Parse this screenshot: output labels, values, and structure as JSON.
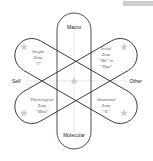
{
  "diagram": {
    "axes": {
      "top": "Macro",
      "bottom": "Molecular",
      "left": "Self",
      "right": "Other"
    },
    "zones": [
      {
        "id": "insight",
        "lines": [
          "Insight",
          "Zone",
          "“I”"
        ]
      },
      {
        "id": "social",
        "lines": [
          "Social",
          "Zone",
          "“Me” or",
          "“Thee”"
        ]
      },
      {
        "id": "physiological",
        "lines": [
          "Physiological",
          "Zone",
          "“Mine”"
        ]
      },
      {
        "id": "situational",
        "lines": [
          "Situational",
          "Zone",
          "“It”"
        ]
      }
    ],
    "colors": {
      "outline": "#222222",
      "grid": "#d8d8d8",
      "star": "#cccccc",
      "text": "#222222",
      "zone_text": "#555555"
    }
  }
}
